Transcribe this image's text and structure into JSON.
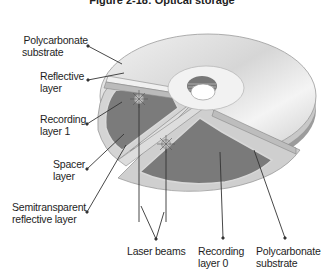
{
  "figure": {
    "title": "Figure 2-18: Optical storage"
  },
  "labels": {
    "polycarbonate_top": [
      "Polycarbonate",
      "substrate"
    ],
    "reflective": [
      "Reflective",
      "layer"
    ],
    "recording1": [
      "Recording",
      "layer 1"
    ],
    "spacer": [
      "Spacer",
      "layer"
    ],
    "semitransparent": [
      "Semitransparent",
      "reflective layer"
    ],
    "laser": [
      "Laser beams"
    ],
    "recording0": [
      "Recording",
      "layer 0"
    ],
    "polycarbonate_bottom": [
      "Polycarbonate",
      "substrate"
    ]
  },
  "colors": {
    "disc_light": "#e2e2e2",
    "disc_mid": "#bdbdbd",
    "recording_layer": "#7a7a7a",
    "edge": "#8a8a8a",
    "line": "#333333"
  }
}
